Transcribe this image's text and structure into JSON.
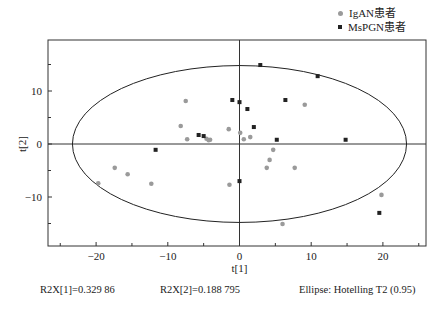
{
  "chart_data": {
    "type": "scatter",
    "title": "",
    "xlabel": "t[1]",
    "ylabel": "t[2]",
    "xlim": [
      -26,
      26
    ],
    "ylim": [
      -19,
      19
    ],
    "xticks": [
      -20,
      -10,
      0,
      10,
      20
    ],
    "yticks": [
      -10,
      0,
      10
    ],
    "grid": false,
    "legend_position": "top-right",
    "ellipse": {
      "label": "Ellipse: Hotelling T2 (0.95)",
      "cx": 0,
      "cy": 0,
      "rx": 23.3,
      "ry": 14.8
    },
    "series": [
      {
        "name": "IgAN患者",
        "marker": "circle",
        "color": "#9a9a9a",
        "points": [
          [
            -19.7,
            -7.4
          ],
          [
            -17.4,
            -4.5
          ],
          [
            -15.6,
            -5.7
          ],
          [
            -12.3,
            -7.5
          ],
          [
            -7.5,
            8.1
          ],
          [
            -8.2,
            3.4
          ],
          [
            -7.3,
            0.9
          ],
          [
            -4.6,
            1.0
          ],
          [
            -4.3,
            0.7
          ],
          [
            -4.1,
            0.8
          ],
          [
            -1.5,
            2.8
          ],
          [
            0.1,
            2.1
          ],
          [
            0.6,
            0.9
          ],
          [
            1.5,
            1.3
          ],
          [
            9.1,
            7.4
          ],
          [
            4.7,
            -1.1
          ],
          [
            4.2,
            -3.0
          ],
          [
            3.8,
            -4.5
          ],
          [
            7.7,
            -4.5
          ],
          [
            -1.4,
            -7.7
          ],
          [
            6.0,
            -15.1
          ],
          [
            19.8,
            -9.6
          ]
        ]
      },
      {
        "name": "MsPGN患者",
        "marker": "square",
        "color": "#222222",
        "points": [
          [
            -11.7,
            -1.1
          ],
          [
            -5.7,
            1.7
          ],
          [
            -5.0,
            1.5
          ],
          [
            -1.0,
            8.3
          ],
          [
            0.0,
            7.9
          ],
          [
            1.1,
            6.6
          ],
          [
            2.0,
            3.2
          ],
          [
            2.9,
            14.9
          ],
          [
            6.4,
            8.3
          ],
          [
            5.2,
            0.8
          ],
          [
            10.9,
            12.8
          ],
          [
            14.8,
            0.8
          ],
          [
            0.0,
            -7.0
          ],
          [
            19.5,
            -13.0
          ]
        ]
      }
    ],
    "annotations": [
      "R2X[1]=0.329 86",
      "R2X[2]=0.188 795",
      "Ellipse: Hotelling T2 (0.95)"
    ]
  },
  "legend": {
    "items": [
      {
        "label": "IgAN患者"
      },
      {
        "label": "MsPGN患者"
      }
    ]
  },
  "footer": {
    "r2x1": "R2X[1]=0.329 86",
    "r2x2": "R2X[2]=0.188 795",
    "ellipse": "Ellipse: Hotelling T2 (0.95)"
  }
}
